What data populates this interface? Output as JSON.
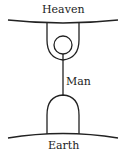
{
  "diagram": {
    "labels": {
      "top": "Heaven",
      "middle": "Man",
      "bottom": "Earth"
    },
    "stroke_color": "#222222"
  }
}
